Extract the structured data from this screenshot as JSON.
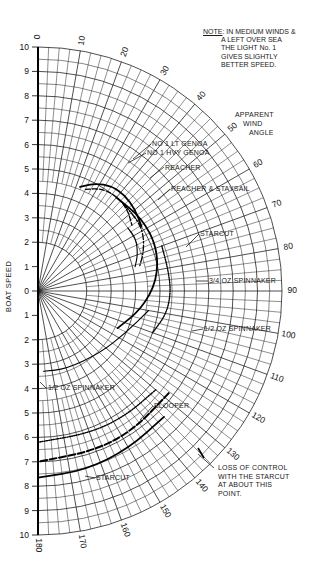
{
  "chart_data": {
    "type": "line",
    "subtype": "polar",
    "title": "",
    "xlabel": "Apparent Wind Angle",
    "ylabel": "Boat Speed",
    "radial_axis": {
      "label": "BOAT SPEED",
      "range": [
        0,
        10
      ],
      "ticks": [
        10,
        9,
        8,
        7,
        6,
        5,
        4,
        3,
        2,
        1,
        0,
        1,
        2,
        3,
        4,
        5,
        6,
        7,
        8,
        9,
        10
      ]
    },
    "angular_axis": {
      "label": "APPARENT WIND ANGLE",
      "range": [
        0,
        180
      ],
      "ticks": [
        0,
        10,
        20,
        30,
        40,
        50,
        60,
        70,
        80,
        90,
        100,
        110,
        120,
        130,
        140,
        150,
        160,
        170,
        180
      ]
    },
    "grid": true,
    "series": [
      {
        "name": "No 1 LT GENOA",
        "style": "solid-heavy",
        "points": [
          [
            22,
            4.6
          ],
          [
            28,
            5.0
          ],
          [
            35,
            5.25
          ],
          [
            42,
            5.3
          ],
          [
            50,
            5.2
          ],
          [
            58,
            5.0
          ]
        ]
      },
      {
        "name": "No 1 HVY GENOA",
        "style": "dashed",
        "points": [
          [
            25,
            4.6
          ],
          [
            32,
            4.95
          ],
          [
            40,
            5.05
          ],
          [
            48,
            4.95
          ],
          [
            55,
            4.7
          ]
        ]
      },
      {
        "name": "REACHER",
        "style": "dash-dot",
        "points": [
          [
            45,
            5.0
          ],
          [
            55,
            5.0
          ],
          [
            62,
            4.9
          ],
          [
            70,
            4.6
          ],
          [
            76,
            4.3
          ]
        ]
      },
      {
        "name": "REACHER & STAYSAIL",
        "style": "solid",
        "points": [
          [
            55,
            4.5
          ],
          [
            62,
            4.55
          ],
          [
            70,
            4.35
          ],
          [
            76,
            4.1
          ]
        ]
      },
      {
        "name": "STARCUT",
        "style": "solid-heavy",
        "points": [
          [
            40,
            5.0
          ],
          [
            55,
            5.2
          ],
          [
            70,
            5.2
          ],
          [
            85,
            4.9
          ],
          [
            100,
            4.3
          ],
          [
            115,
            3.6
          ]
        ]
      },
      {
        "name": "3/4 OZ SPINNAKER",
        "style": "dotted",
        "points": [
          [
            70,
            5.4
          ],
          [
            80,
            5.4
          ],
          [
            90,
            5.45
          ],
          [
            100,
            5.35
          ],
          [
            110,
            5.0
          ]
        ]
      },
      {
        "name": "1/2 OZ SPINNAKER",
        "style": "solid",
        "points": [
          [
            100,
            4.6
          ],
          [
            115,
            4.0
          ],
          [
            135,
            3.6
          ],
          [
            160,
            3.4
          ],
          [
            176,
            3.3
          ]
        ]
      },
      {
        "name": "BLOOPER (dotted)",
        "style": "dotted",
        "points": [
          [
            130,
            6.3
          ],
          [
            145,
            6.25
          ],
          [
            160,
            6.2
          ],
          [
            180,
            6.2
          ]
        ]
      },
      {
        "name": "BLOOPER (dashed)",
        "style": "dashed-heavy",
        "points": [
          [
            128,
            6.8
          ],
          [
            145,
            6.9
          ],
          [
            160,
            6.95
          ],
          [
            180,
            7.0
          ]
        ]
      },
      {
        "name": "STARCUT (running)",
        "style": "solid-heavy",
        "points": [
          [
            135,
            7.3
          ],
          [
            150,
            7.45
          ],
          [
            165,
            7.6
          ],
          [
            180,
            7.65
          ]
        ]
      }
    ],
    "annotations": [
      "NOTE: IN MEDIUM WINDS & A LEFT OVER SEA THE LIGHT No. 1 GIVES SLIGHTLY BETTER SPEED.",
      "LOSS OF CONTROL WITH THE STARCUT AT ABOUT THIS POINT."
    ]
  },
  "labels": {
    "note_head": "NOTE",
    "note_lines": [
      ": IN MEDIUM WINDS &",
      "A LEFT OVER SEA",
      "THE LIGHT No. 1",
      "GIVES SLIGHTLY",
      "BETTER SPEED."
    ],
    "awa": [
      "APPARENT",
      "WIND",
      "ANGLE"
    ],
    "boat_speed": "BOAT SPEED",
    "lt_genoa": "No 1 LT GENOA",
    "hvy_genoa": "No 1 HVY GENOA",
    "reacher": "REACHER",
    "reacher_staysail": "REACHER & STAYSAIL",
    "starcut": "STARCUT",
    "spin_34": "3/4 OZ SPINNAKER",
    "spin_12_right": "1/2 OZ SPINNAKER",
    "spin_12_left": "1/2 OZ SPINNAKER",
    "blooper": "BLOOPER",
    "starcut_lower": "STARCUT",
    "loss": [
      "LOSS OF CONTROL",
      "WITH THE STARCUT",
      "AT ABOUT THIS",
      "POINT."
    ]
  }
}
